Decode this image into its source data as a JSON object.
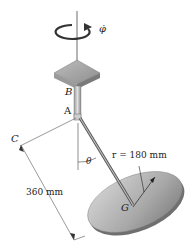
{
  "diagram": {
    "labels": {
      "phi_dot": "φ̇",
      "B": "B",
      "A": "A",
      "C": "C",
      "G": "G",
      "theta": "θ"
    },
    "dimensions": {
      "radius": "r = 180 mm",
      "length": "360 mm"
    }
  }
}
